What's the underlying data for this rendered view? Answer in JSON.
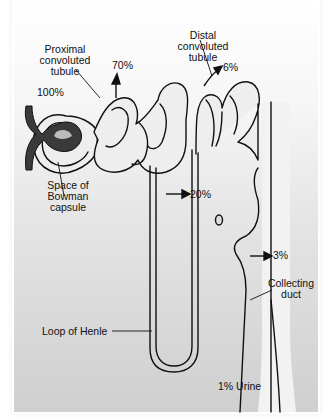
{
  "diagram": {
    "labels": {
      "proximal": [
        "Proximal",
        "convoluted",
        "tubule"
      ],
      "distal": [
        "Distal",
        "convoluted",
        "tubule"
      ],
      "bowman": [
        "Space of",
        "Bowman",
        "capsule"
      ],
      "loop": "Loop of Henle",
      "collecting": [
        "Collecting",
        "duct"
      ]
    },
    "percentages": {
      "glomerulus": "100%",
      "proximal": "70%",
      "distal": "6%",
      "loop": "20%",
      "collecting": "3%",
      "urine": "1% Urine"
    },
    "colors": {
      "tubule_fill": "#ededed",
      "outline": "#111111",
      "glomerulus": "#3a3a3a"
    }
  }
}
